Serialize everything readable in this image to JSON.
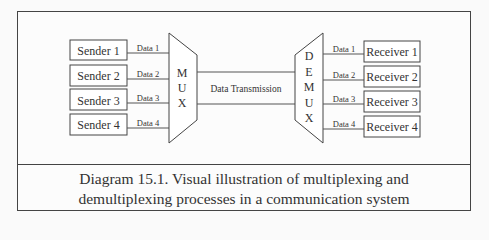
{
  "diagram": {
    "senders": [
      {
        "label": "Sender 1",
        "data": "Data 1"
      },
      {
        "label": "Sender 2",
        "data": "Data 2"
      },
      {
        "label": "Sender 3",
        "data": "Data 3"
      },
      {
        "label": "Sender 4",
        "data": "Data 4"
      }
    ],
    "mux": {
      "letters": [
        "M",
        "U",
        "X"
      ]
    },
    "transmission_label": "Data Transmission",
    "demux": {
      "letters": [
        "D",
        "E",
        "M",
        "U",
        "X"
      ]
    },
    "receivers": [
      {
        "label": "Receiver 1",
        "data": "Data 1"
      },
      {
        "label": "Receiver 2",
        "data": "Data 2"
      },
      {
        "label": "Receiver 3",
        "data": "Data 3"
      },
      {
        "label": "Receiver 4",
        "data": "Data 4"
      }
    ]
  },
  "caption": {
    "line1": "Diagram 15.1. Visual illustration of multiplexing and",
    "line2": "demultiplexing processes in a communication system"
  }
}
